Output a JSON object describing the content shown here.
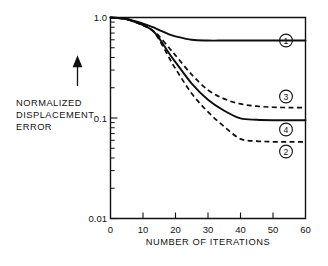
{
  "figure": {
    "name": "normalized-displacement-error-vs-iterations",
    "background_color": "#ffffff",
    "ink_color": "#111111"
  },
  "ylabel": {
    "line1": "NORMALIZED",
    "line2": "DISPLACEMENT",
    "line3": "ERROR",
    "arrow_icon": "up-arrow-icon"
  },
  "axes": {
    "x_title": "NUMBER OF ITERATIONS",
    "x_ticks": [
      "0",
      "10",
      "20",
      "30",
      "40",
      "50",
      "60"
    ],
    "y_ticks": [
      "1.0",
      "0.1",
      "0.01"
    ]
  },
  "markers": [
    {
      "id": "curve-marker-1",
      "label": "1"
    },
    {
      "id": "curve-marker-3",
      "label": "3"
    },
    {
      "id": "curve-marker-4",
      "label": "4"
    },
    {
      "id": "curve-marker-2",
      "label": "2"
    }
  ],
  "chart_data": {
    "type": "line",
    "title": "",
    "xlabel": "NUMBER OF ITERATIONS",
    "ylabel": "NORMALIZED DISPLACEMENT ERROR",
    "xlim": [
      0,
      60
    ],
    "ylim": [
      0.01,
      1.0
    ],
    "yscale": "log",
    "xticks": [
      0,
      10,
      20,
      30,
      40,
      50,
      60
    ],
    "yticks": [
      0.01,
      0.1,
      1.0
    ],
    "grid": false,
    "legend": "inline-circled-numbers",
    "x": [
      0,
      5,
      10,
      13,
      15,
      18,
      20,
      25,
      30,
      35,
      40,
      45,
      50,
      55,
      60
    ],
    "series": [
      {
        "name": "1",
        "style": "solid",
        "label": "1",
        "values": [
          1.0,
          0.97,
          0.87,
          0.8,
          0.75,
          0.68,
          0.65,
          0.6,
          0.59,
          0.59,
          0.59,
          0.59,
          0.59,
          0.59,
          0.59
        ]
      },
      {
        "name": "3",
        "style": "dashed",
        "label": "3",
        "values": [
          1.0,
          0.96,
          0.84,
          0.74,
          0.65,
          0.5,
          0.42,
          0.27,
          0.19,
          0.155,
          0.138,
          0.131,
          0.128,
          0.127,
          0.127
        ]
      },
      {
        "name": "4",
        "style": "solid",
        "label": "4",
        "values": [
          1.0,
          0.96,
          0.84,
          0.74,
          0.62,
          0.44,
          0.36,
          0.22,
          0.152,
          0.118,
          0.099,
          0.096,
          0.095,
          0.095,
          0.095
        ]
      },
      {
        "name": "2",
        "style": "dashed",
        "label": "2",
        "values": [
          1.0,
          0.96,
          0.84,
          0.74,
          0.6,
          0.4,
          0.31,
          0.175,
          0.115,
          0.082,
          0.062,
          0.059,
          0.058,
          0.058,
          0.058
        ]
      }
    ]
  }
}
